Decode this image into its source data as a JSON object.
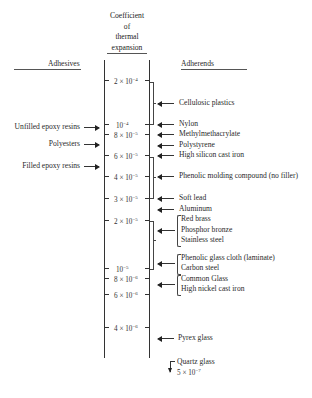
{
  "header": {
    "title_lines": [
      "Coefficient",
      "of",
      "thermal",
      "expansion"
    ],
    "left_heading": "Adhesives",
    "right_heading": "Adherends"
  },
  "scale": {
    "ticks": [
      {
        "label": "2 × 10",
        "exp": "−4",
        "y": 80
      },
      {
        "label": "10",
        "exp": "−4",
        "y": 124
      },
      {
        "label": "8 × 10",
        "exp": "−5",
        "y": 134
      },
      {
        "label": "6 × 10",
        "exp": "−5",
        "y": 155
      },
      {
        "label": "4 × 10",
        "exp": "−5",
        "y": 176
      },
      {
        "label": "3 × 10",
        "exp": "−5",
        "y": 198
      },
      {
        "label": "2 × 10",
        "exp": "−5",
        "y": 220
      },
      {
        "label": "10",
        "exp": "−5",
        "y": 268
      },
      {
        "label": "8 × 10",
        "exp": "−6",
        "y": 278
      },
      {
        "label": "6 × 10",
        "exp": "−6",
        "y": 294
      },
      {
        "label": "4 × 10",
        "exp": "−6",
        "y": 327
      }
    ]
  },
  "adhesives": [
    {
      "label": "Unfilled epoxy resins",
      "y": 127
    },
    {
      "label": "Polyesters",
      "y": 144
    },
    {
      "label": "Filled epoxy resins",
      "y": 166
    }
  ],
  "adherends": [
    {
      "label": "Cellulosic plastics",
      "y": 103
    },
    {
      "label": "Nylon",
      "y": 124
    },
    {
      "label": "Methylmethacrylate",
      "y": 134
    },
    {
      "label": "Polystyrene",
      "y": 145
    },
    {
      "label": "High silicon cast iron",
      "y": 155
    },
    {
      "label": "Phenolic molding compound (no filler)",
      "y": 176
    },
    {
      "label": "Soft lead",
      "y": 198
    },
    {
      "label": "Aluminum",
      "y": 209
    }
  ],
  "adherend_groups": [
    {
      "items": [
        "Red brass",
        "Phosphor bronze",
        "Stainless steel"
      ],
      "y": 230
    },
    {
      "items": [
        "Phenolic glass cloth (laminate)",
        "Carbon steel"
      ],
      "y": 263
    },
    {
      "items": [
        "Common Glass",
        "High nickel cast iron"
      ],
      "y": 284
    }
  ],
  "pyrex": {
    "label": "Pyrex glass",
    "y": 338
  },
  "quartz": {
    "label": "Quartz glass",
    "value": "5 × 10",
    "exp": "−7"
  }
}
